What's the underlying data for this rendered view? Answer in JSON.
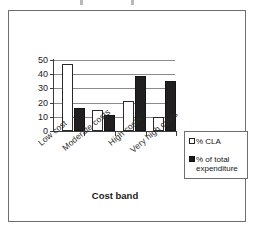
{
  "chart_data": {
    "type": "bar",
    "title": "",
    "xlabel": "Cost band",
    "ylabel": "",
    "categories": [
      "Low cost",
      "Moderate costs",
      "High costs",
      "Very high costs"
    ],
    "series": [
      {
        "name": "% CLA",
        "values": [
          47,
          15,
          21,
          10
        ],
        "color": "#ffffff"
      },
      {
        "name": "% of total expenditure",
        "values": [
          16,
          11,
          39,
          35
        ],
        "color": "#211f1f"
      }
    ],
    "ylim": [
      0,
      50
    ],
    "yticks": [
      0,
      10,
      20,
      30,
      40,
      50
    ],
    "ytick_labels": [
      "0",
      "10",
      "20",
      "30",
      "40",
      "50"
    ],
    "grid": true,
    "legend_position": "bottom-right"
  },
  "legend": {
    "items": [
      {
        "label": "% CLA",
        "swatch": "light"
      },
      {
        "label": "% of total\nexpenditure",
        "swatch": "dark"
      }
    ]
  },
  "axis": {
    "x_title": "Cost band"
  }
}
